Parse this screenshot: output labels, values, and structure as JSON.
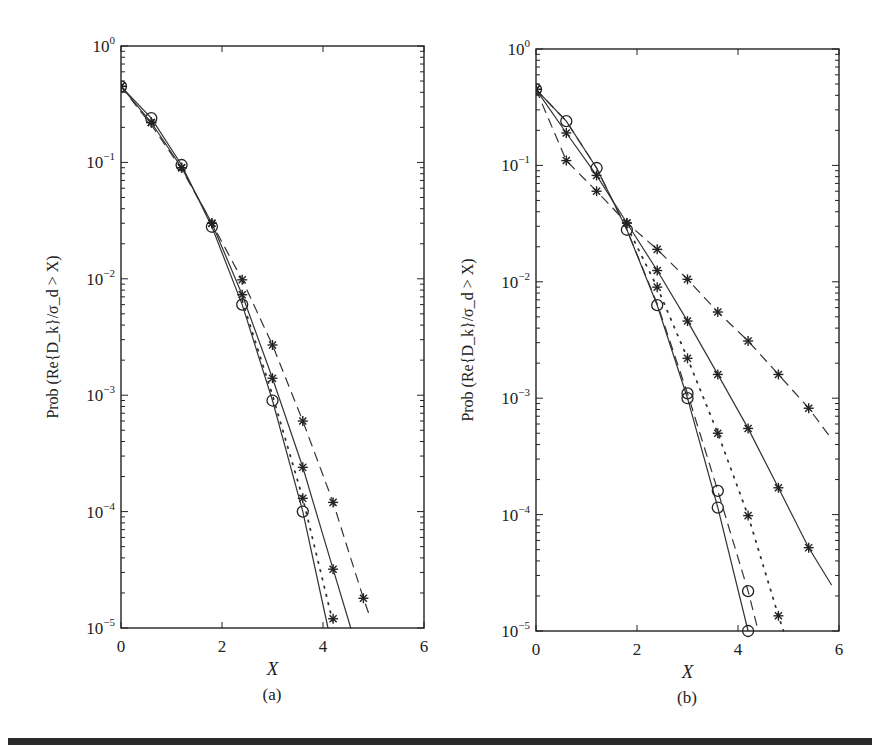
{
  "figure": {
    "panels": [
      "(a)",
      "(b)"
    ],
    "x_label": "X",
    "y_label": "Prob (Re{D_k}/σ_d > X)",
    "x_ticks": [
      "0",
      "2",
      "4",
      "6"
    ],
    "y_ticks": [
      {
        "base": "10",
        "exp": "0"
      },
      {
        "base": "10",
        "exp": "−1"
      },
      {
        "base": "10",
        "exp": "−2"
      },
      {
        "base": "10",
        "exp": "−3"
      },
      {
        "base": "10",
        "exp": "−4"
      },
      {
        "base": "10",
        "exp": "−5"
      }
    ]
  },
  "chart_data": [
    {
      "type": "line",
      "title": "(a)",
      "xlabel": "X",
      "ylabel": "Prob (Re{D_k}/σ_d > X)",
      "xlim": [
        0,
        6
      ],
      "ylim": [
        1e-05,
        1
      ],
      "yscale": "log",
      "grid": false,
      "legend": null,
      "series": [
        {
          "name": "circles-solid",
          "marker": "circle",
          "line": "solid",
          "x": [
            0,
            0.6,
            1.2,
            1.8,
            2.4,
            3.0,
            3.6
          ],
          "y": [
            0.45,
            0.24,
            0.095,
            0.028,
            0.006,
            0.0009,
            0.0001
          ],
          "line_x": [
            0,
            0.6,
            1.2,
            1.8,
            2.4,
            3.0,
            3.6,
            4.1
          ],
          "line_y": [
            0.45,
            0.24,
            0.095,
            0.028,
            0.006,
            0.0009,
            0.0001,
            1e-05
          ]
        },
        {
          "name": "stars-solid",
          "marker": "star",
          "line": "solid",
          "x": [
            0,
            0.6,
            1.2,
            1.8,
            2.4,
            3.0,
            3.6,
            4.2
          ],
          "y": [
            0.45,
            0.22,
            0.09,
            0.03,
            0.0073,
            0.0014,
            0.00024,
            3.2e-05
          ],
          "line_x": [
            0,
            0.6,
            1.2,
            1.8,
            2.4,
            3.0,
            3.6,
            4.2,
            4.55
          ],
          "line_y": [
            0.45,
            0.22,
            0.09,
            0.03,
            0.0073,
            0.0014,
            0.00024,
            3.2e-05,
            1e-05
          ]
        },
        {
          "name": "stars-dashed",
          "marker": "star",
          "line": "dashed",
          "x": [
            0,
            0.6,
            1.2,
            1.8,
            2.4,
            3.0,
            3.6,
            4.2,
            4.8
          ],
          "y": [
            0.45,
            0.22,
            0.09,
            0.03,
            0.0098,
            0.0027,
            0.0006,
            0.00012,
            1.8e-05
          ],
          "line_x": [
            0,
            0.6,
            1.2,
            1.8,
            2.4,
            3.0,
            3.6,
            4.2,
            4.8,
            4.9
          ],
          "line_y": [
            0.45,
            0.21,
            0.088,
            0.03,
            0.0098,
            0.0027,
            0.0006,
            0.00012,
            1.8e-05,
            1.35e-05
          ]
        },
        {
          "name": "stars-dotted",
          "marker": "star",
          "line": "dotted",
          "x": [
            3.6,
            4.2
          ],
          "y": [
            0.00013,
            1.2e-05
          ],
          "line_x": [
            2.4,
            3.0,
            3.6,
            4.2
          ],
          "line_y": [
            0.0065,
            0.001,
            0.00013,
            1.1e-05
          ]
        }
      ]
    },
    {
      "type": "line",
      "title": "(b)",
      "xlabel": "X",
      "ylabel": "Prob (Re{D_k}/σ_d > X)",
      "xlim": [
        0,
        6
      ],
      "ylim": [
        1e-05,
        1
      ],
      "yscale": "log",
      "grid": false,
      "legend": null,
      "series": [
        {
          "name": "circles-solid",
          "marker": "circle",
          "line": "solid",
          "x": [
            0,
            0.6,
            1.2,
            1.8,
            2.4,
            3.0,
            3.6,
            4.2
          ],
          "y": [
            0.45,
            0.24,
            0.095,
            0.028,
            0.0063,
            0.001,
            0.000115,
            1e-05
          ],
          "line_x": [
            0,
            0.6,
            1.2,
            1.8,
            2.4,
            3.0,
            3.6,
            4.2
          ],
          "line_y": [
            0.45,
            0.24,
            0.095,
            0.028,
            0.0063,
            0.001,
            0.000115,
            1e-05
          ]
        },
        {
          "name": "circles-dashdot",
          "marker": "circle",
          "line": "dashed",
          "x": [
            3.0,
            3.6,
            4.2
          ],
          "y": [
            0.0011,
            0.00016,
            2.2e-05
          ],
          "line_x": [
            0,
            0.6,
            1.2,
            1.8,
            2.4,
            3.0,
            3.6,
            4.2,
            4.4
          ],
          "line_y": [
            0.45,
            0.24,
            0.095,
            0.028,
            0.0065,
            0.0011,
            0.00016,
            2.2e-05,
            1e-05
          ]
        },
        {
          "name": "stars-solid",
          "marker": "star",
          "line": "solid",
          "x": [
            0,
            0.6,
            1.2,
            1.8,
            2.4,
            3.0,
            3.6,
            4.2,
            4.8,
            5.4
          ],
          "y": [
            0.45,
            0.19,
            0.082,
            0.032,
            0.0125,
            0.0046,
            0.0016,
            0.00055,
            0.00017,
            5.2e-05
          ],
          "line_x": [
            0,
            0.6,
            1.2,
            1.8,
            2.4,
            3.0,
            3.6,
            4.2,
            4.8,
            5.4,
            5.85
          ],
          "line_y": [
            0.45,
            0.19,
            0.082,
            0.032,
            0.0125,
            0.0046,
            0.0016,
            0.00055,
            0.00017,
            5.2e-05,
            2.5e-05
          ]
        },
        {
          "name": "stars-dashed",
          "marker": "star",
          "line": "dashed",
          "x": [
            0,
            0.6,
            1.2,
            1.8,
            2.4,
            3.0,
            3.6,
            4.2,
            4.8,
            5.4
          ],
          "y": [
            0.45,
            0.11,
            0.06,
            0.032,
            0.019,
            0.0105,
            0.0055,
            0.0031,
            0.0016,
            0.00082
          ],
          "line_x": [
            0,
            0.6,
            1.2,
            1.8,
            2.4,
            3.0,
            3.6,
            4.2,
            4.8,
            5.4,
            5.85
          ],
          "line_y": [
            0.45,
            0.11,
            0.06,
            0.032,
            0.019,
            0.0105,
            0.0055,
            0.0031,
            0.0016,
            0.00082,
            0.00045
          ]
        },
        {
          "name": "stars-dotted",
          "marker": "star",
          "line": "dotted",
          "x": [
            2.4,
            3.0,
            3.6,
            4.2,
            4.8
          ],
          "y": [
            0.009,
            0.0022,
            0.0005,
            9.8e-05,
            1.35e-05
          ],
          "line_x": [
            1.8,
            2.4,
            3.0,
            3.6,
            4.2,
            4.8,
            4.9
          ],
          "line_y": [
            0.03,
            0.009,
            0.0022,
            0.0005,
            9.8e-05,
            1.35e-05,
            1e-05
          ]
        }
      ]
    }
  ]
}
